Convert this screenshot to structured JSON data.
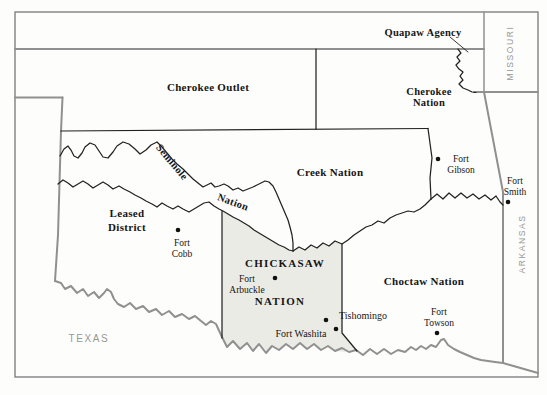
{
  "map": {
    "title_hint": "Indian Territory map",
    "regions": {
      "quapaw_agency": "Quapaw Agency",
      "cherokee_outlet": "Cherokee Outlet",
      "cherokee_nation_l1": "Cherokee",
      "cherokee_nation_l2": "Nation",
      "creek_nation": "Creek Nation",
      "seminole_l1": "Seminole",
      "seminole_l2": "Nation",
      "leased_district_l1": "Leased",
      "leased_district_l2": "District",
      "chickasaw_l1": "CHICKASAW",
      "chickasaw_l2": "NATION",
      "choctaw_nation": "Choctaw Nation"
    },
    "states": {
      "missouri": "MISSOURI",
      "arkansas": "ARKANSAS",
      "texas": "TEXAS"
    },
    "places": {
      "fort_gibson_l1": "Fort",
      "fort_gibson_l2": "Gibson",
      "fort_smith_l1": "Fort",
      "fort_smith_l2": "Smith",
      "fort_cobb_l1": "Fort",
      "fort_cobb_l2": "Cobb",
      "fort_arbuckle_l1": "Fort",
      "fort_arbuckle_l2": "Arbuckle",
      "fort_washita": "Fort Washita",
      "tishomingo": "Tishomingo",
      "fort_towson_l1": "Fort",
      "fort_towson_l2": "Towson"
    },
    "colors": {
      "chickasaw_fill": "#ebebe5",
      "state_line": "#909090",
      "border_line": "#222222",
      "state_label": "#979797",
      "label_text": "#161616"
    }
  }
}
